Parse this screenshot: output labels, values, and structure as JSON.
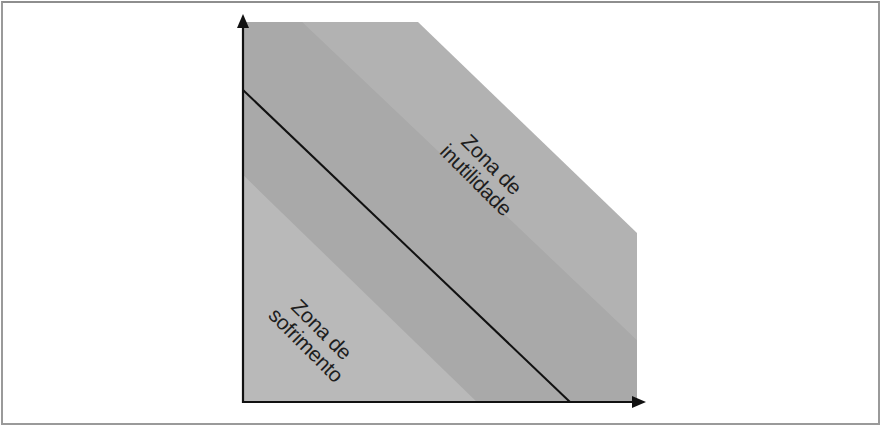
{
  "diagram": {
    "type": "zone diagram",
    "labels": {
      "upper_zone_line1": "Zona de",
      "upper_zone_line2": "inutilidade",
      "lower_zone_line1": "Zona de",
      "lower_zone_line2": "sofrimento"
    },
    "colors": {
      "background": "#ffffff",
      "frame": "#9a9a9a",
      "upper_region": "#b2b2b2",
      "middle_band": "#a9a9a9",
      "lower_region": "#b9b9b9",
      "line": "#111111",
      "axes": "#111111"
    }
  }
}
